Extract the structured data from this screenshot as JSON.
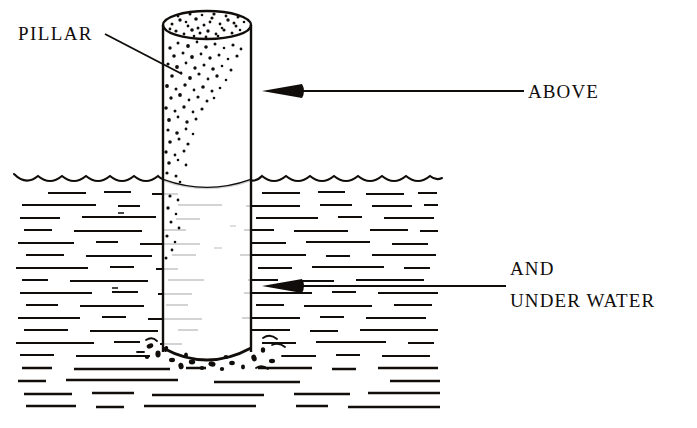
{
  "figure": {
    "title": "Pillar above and under water",
    "background_color": "#ffffff",
    "ink_color": "#100d0b"
  },
  "labels": {
    "pillar": {
      "text": "PILLAR",
      "x": 18,
      "y": 40
    },
    "above": {
      "text": "ABOVE",
      "x": 528,
      "y": 98
    },
    "and": {
      "text": "AND",
      "x": 510,
      "y": 275
    },
    "under_water": {
      "text": "UNDER WATER",
      "x": 510,
      "y": 307
    }
  },
  "leaders": {
    "pillar_leader": {
      "x1": 105,
      "y1": 34,
      "x2": 182,
      "y2": 74
    },
    "above_leader": {
      "x1": 300,
      "y1": 91,
      "x2": 524,
      "y2": 91,
      "arrow_tip_x": 262,
      "arrow_tail_x": 302,
      "arrow_y": 91
    },
    "under_water_leader": {
      "x1": 300,
      "y1": 286,
      "x2": 506,
      "y2": 286,
      "arrow_tip_x": 262,
      "arrow_tail_x": 302,
      "arrow_y": 286
    }
  },
  "pillar": {
    "name": "cylindrical pillar",
    "left_x": 163,
    "right_x": 251,
    "top_y": 25,
    "bottom_y": 352,
    "top_ellipse_ry": 14,
    "bottom_ellipse_ry": 15,
    "waterline_ellipse_y": 180,
    "waterline_ellipse_ry": 13,
    "shaded_face": "left",
    "shading_style": "stipple"
  },
  "water": {
    "surface_y": 178,
    "left_x": 14,
    "right_x": 440,
    "bottom_y": 414,
    "wave_count": 17,
    "wave_width": 25,
    "hatch_style": "horizontal dashes"
  },
  "seabed": {
    "debris_center_x": 207,
    "debris_y": 360,
    "description": "rubble and scour marks around pillar base"
  }
}
